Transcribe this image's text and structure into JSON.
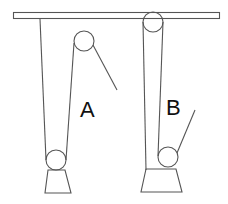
{
  "diagram": {
    "type": "pulley-system-comparison",
    "colors": {
      "line": "#555555",
      "label": "#111111",
      "background": "#ffffff"
    },
    "systems": [
      {
        "id": "A",
        "label": "A",
        "description": "Fixed pulley on ceiling-attached rope, movable pulley supporting load"
      },
      {
        "id": "B",
        "label": "B",
        "description": "Pulley fixed at ceiling, movable pulley at load with pulled free end"
      }
    ],
    "ceiling": {
      "name": "ceiling-beam"
    }
  }
}
